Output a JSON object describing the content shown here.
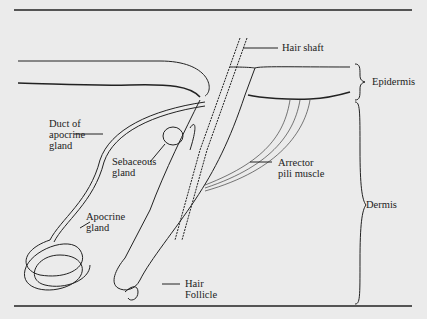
{
  "figure": {
    "labels": {
      "hair_shaft": "Hair shaft",
      "epidermis": "Epidermis",
      "duct_line1": "Duct of",
      "duct_line2": "apocrine",
      "duct_line3": "gland",
      "sebaceous_line1": "Sebaceous",
      "sebaceous_line2": "gland",
      "arrector_line1": "Arrector",
      "arrector_line2": "pili muscle",
      "dermis": "Dermis",
      "apocrine_line1": "Apocrine",
      "apocrine_line2": "gland",
      "follicle_line1": "Hair",
      "follicle_line2": "Follicle"
    },
    "colors": {
      "background": "#ebebeb",
      "ink": "#222222"
    }
  }
}
